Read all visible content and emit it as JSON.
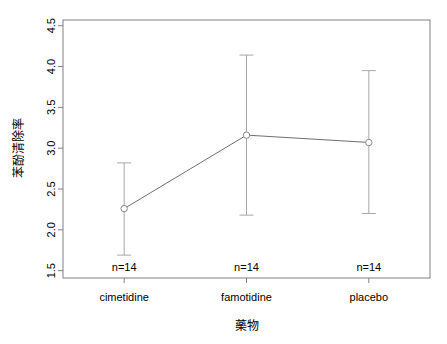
{
  "chart_data": {
    "type": "line",
    "title": "",
    "subtitle": "",
    "xlabel": "藥物",
    "ylabel": "苯酚清除率",
    "categories": [
      "cimetidine",
      "famotidine",
      "placebo"
    ],
    "values": [
      2.26,
      3.16,
      3.07
    ],
    "series": [
      {
        "name": "mean",
        "values": [
          2.26,
          3.16,
          3.07
        ],
        "lower": [
          1.69,
          2.18,
          2.2
        ],
        "upper": [
          2.82,
          4.14,
          3.95
        ]
      }
    ],
    "error_bars": true,
    "point_labels": [
      "n=14",
      "n=14",
      "n=14"
    ],
    "yticks": [
      1.5,
      2.0,
      2.5,
      3.0,
      3.5,
      4.0,
      4.5
    ],
    "ytick_labels": [
      "1.5",
      "2.0",
      "2.5",
      "3.0",
      "3.5",
      "4.0",
      "4.5"
    ],
    "ylim": [
      1.41,
      4.57
    ],
    "xlim": [
      0.5,
      3.5
    ],
    "grid": false,
    "legend": null,
    "colors": {
      "line": "#707070",
      "errorbar": "#a8a8a8",
      "marker_stroke": "#8a8a8a",
      "marker_fill": "#ffffff",
      "frame": "#808080",
      "text": "#000000",
      "background": "#ffffff"
    }
  }
}
